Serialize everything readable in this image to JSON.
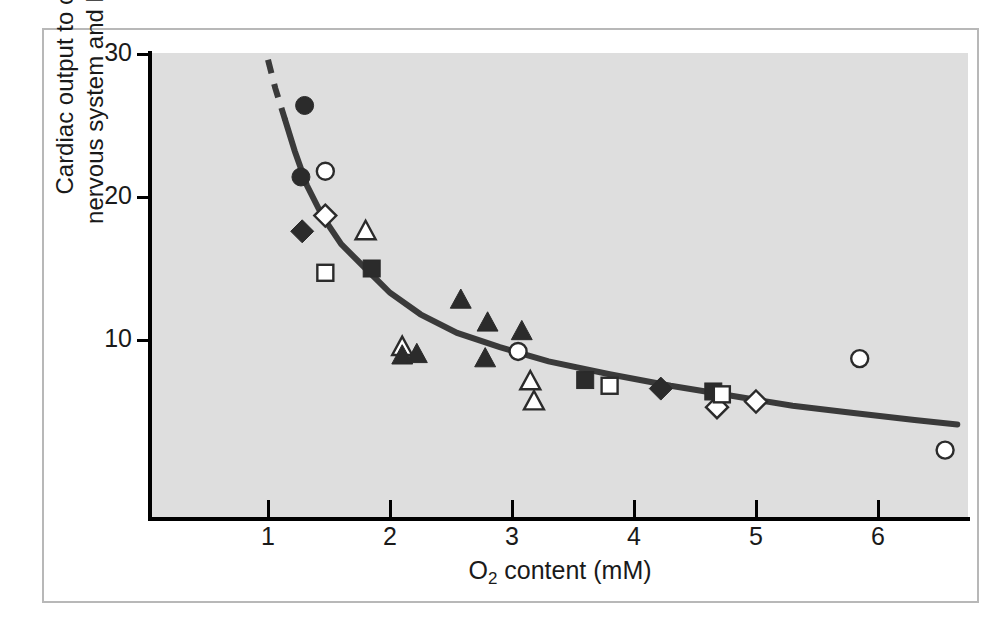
{
  "figure": {
    "background_color": "#ffffff",
    "panel_color": "#dedede",
    "frame_color": "#b8b8b8",
    "curve_color": "#3a3a3a",
    "marker_fill_color": "#2b2b2b",
    "marker_open_color": "#ffffff"
  },
  "chart_data": {
    "type": "scatter",
    "title": "",
    "subtitle": "",
    "xlabel": "O2 content (mM)",
    "xlabel_parts": {
      "pre": "O",
      "sub": "2",
      "post": " content (mM)"
    },
    "ylabel": "Cardiac output to central nervous system and heart (%)",
    "ylabel_line1": "Cardiac output to central",
    "ylabel_line2": "nervous system and heart (%)",
    "xlim": [
      0.0,
      6.75
    ],
    "ylim": [
      0.0,
      30.0
    ],
    "xticks": [
      1,
      2,
      3,
      4,
      5,
      6
    ],
    "xtick_labels": [
      "1",
      "2",
      "3",
      "4",
      "5",
      "6"
    ],
    "yticks": [
      10,
      20,
      30
    ],
    "ytick_labels": [
      "10",
      "20",
      "30"
    ],
    "grid": false,
    "legend_position": "none",
    "series": [
      {
        "name": "filled-circle",
        "marker": "filled-circle",
        "points": [
          {
            "x": 1.3,
            "y": 26.4
          },
          {
            "x": 1.27,
            "y": 21.4
          }
        ]
      },
      {
        "name": "open-circle",
        "marker": "open-circle",
        "points": [
          {
            "x": 1.47,
            "y": 21.8
          },
          {
            "x": 3.05,
            "y": 9.2
          },
          {
            "x": 5.85,
            "y": 8.7
          },
          {
            "x": 6.55,
            "y": 2.3
          }
        ]
      },
      {
        "name": "filled-diamond",
        "marker": "filled-diamond",
        "points": [
          {
            "x": 1.28,
            "y": 17.6
          },
          {
            "x": 4.22,
            "y": 6.6
          }
        ]
      },
      {
        "name": "open-diamond",
        "marker": "open-diamond",
        "points": [
          {
            "x": 1.47,
            "y": 18.7
          },
          {
            "x": 4.68,
            "y": 5.3
          },
          {
            "x": 5.0,
            "y": 5.7
          }
        ]
      },
      {
        "name": "open-triangle",
        "marker": "open-triangle",
        "points": [
          {
            "x": 1.8,
            "y": 17.6
          },
          {
            "x": 2.1,
            "y": 9.5
          },
          {
            "x": 3.15,
            "y": 7.1
          },
          {
            "x": 3.18,
            "y": 5.7
          }
        ]
      },
      {
        "name": "filled-triangle",
        "marker": "filled-triangle",
        "points": [
          {
            "x": 2.1,
            "y": 8.9
          },
          {
            "x": 2.22,
            "y": 9.0
          },
          {
            "x": 2.58,
            "y": 12.8
          },
          {
            "x": 2.78,
            "y": 8.7
          },
          {
            "x": 2.8,
            "y": 11.2
          },
          {
            "x": 3.08,
            "y": 10.6
          }
        ]
      },
      {
        "name": "filled-square",
        "marker": "filled-square",
        "points": [
          {
            "x": 1.85,
            "y": 15.0
          },
          {
            "x": 3.6,
            "y": 7.2
          },
          {
            "x": 4.65,
            "y": 6.4
          }
        ]
      },
      {
        "name": "open-square",
        "marker": "open-square",
        "points": [
          {
            "x": 1.47,
            "y": 14.7
          },
          {
            "x": 3.8,
            "y": 6.8
          },
          {
            "x": 4.72,
            "y": 6.2
          }
        ]
      }
    ],
    "fit_curve": {
      "name": "fitted-hyperbolic-curve",
      "solid_points": [
        {
          "x": 1.14,
          "y": 25.4
        },
        {
          "x": 1.22,
          "y": 23.2
        },
        {
          "x": 1.32,
          "y": 20.8
        },
        {
          "x": 1.45,
          "y": 18.6
        },
        {
          "x": 1.6,
          "y": 16.7
        },
        {
          "x": 1.8,
          "y": 15.0
        },
        {
          "x": 2.0,
          "y": 13.3
        },
        {
          "x": 2.25,
          "y": 11.8
        },
        {
          "x": 2.55,
          "y": 10.5
        },
        {
          "x": 2.9,
          "y": 9.5
        },
        {
          "x": 3.3,
          "y": 8.5
        },
        {
          "x": 3.8,
          "y": 7.6
        },
        {
          "x": 4.3,
          "y": 6.8
        },
        {
          "x": 4.8,
          "y": 6.1
        },
        {
          "x": 5.3,
          "y": 5.4
        },
        {
          "x": 5.8,
          "y": 4.9
        },
        {
          "x": 6.3,
          "y": 4.4
        },
        {
          "x": 6.65,
          "y": 4.1
        }
      ],
      "dashed_points": [
        {
          "x": 1.0,
          "y": 29.6
        },
        {
          "x": 1.06,
          "y": 27.6
        },
        {
          "x": 1.14,
          "y": 25.4
        }
      ],
      "dashed_label": "extrapolated"
    }
  }
}
